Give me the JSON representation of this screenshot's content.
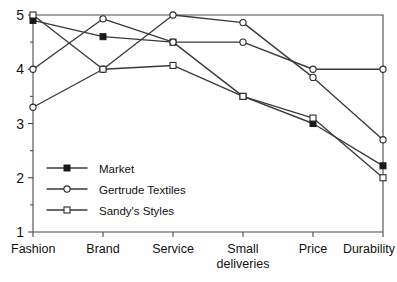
{
  "chart_data": {
    "type": "line",
    "title": "",
    "xlabel": "",
    "ylabel": "",
    "ylim": [
      1,
      5
    ],
    "yticks": [
      1,
      2,
      3,
      4,
      5
    ],
    "ytick_labels": [
      "1",
      "2",
      "3",
      "4",
      "5"
    ],
    "yminor_ticks": [
      1.5,
      2.5,
      3.5,
      4.5
    ],
    "grid": false,
    "legend_position": "lower-left-inside",
    "categories": [
      "Fashion",
      "Brand",
      "Service",
      "Small deliveries",
      "Price",
      "Durability"
    ],
    "category_labels": [
      [
        "Fashion"
      ],
      [
        "Brand"
      ],
      [
        "Service"
      ],
      [
        "Small",
        "deliveries"
      ],
      [
        "Price"
      ],
      [
        "Durability"
      ]
    ],
    "series": [
      {
        "name": "Market",
        "marker": "filled-square",
        "values": [
          4.9,
          4.6,
          4.5,
          3.5,
          3.0,
          2.22
        ]
      },
      {
        "name": "Gertrude Textiles",
        "marker": "open-circle",
        "values": [
          4.0,
          4.93,
          4.5,
          4.5,
          4.0,
          4.0
        ]
      },
      {
        "name": "Gertrude Textiles",
        "marker": "open-circle",
        "values": [
          3.3,
          4.0,
          5.0,
          4.86,
          3.85,
          2.7
        ]
      },
      {
        "name": "Sandy's Styles",
        "marker": "open-square",
        "values": [
          5.0,
          4.0,
          4.07,
          3.5,
          3.1,
          2.0
        ]
      }
    ],
    "legend": [
      {
        "label": "Market",
        "marker": "filled-square"
      },
      {
        "label": "Gertrude Textiles",
        "marker": "open-circle"
      },
      {
        "label": "Sandy's Styles",
        "marker": "open-square"
      }
    ],
    "colors": {
      "line": "#3a3a3a",
      "axis": "#4a4a4a",
      "marker_fill_open": "#ffffff",
      "marker_fill_solid": "#1a1a1a",
      "background": "#ffffff"
    }
  }
}
